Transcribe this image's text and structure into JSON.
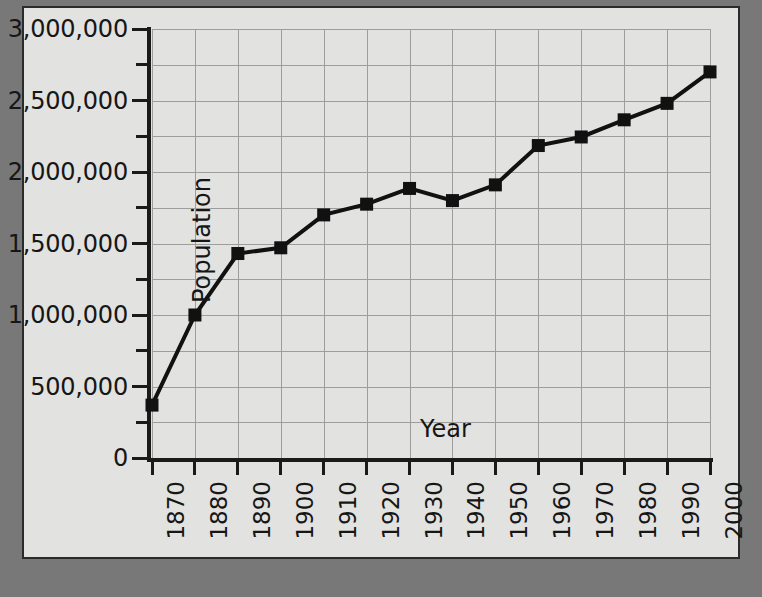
{
  "chart_data": {
    "type": "line",
    "title": "",
    "xlabel": "Year",
    "ylabel": "Population",
    "grid": true,
    "legend": false,
    "xlim": [
      1870,
      2000
    ],
    "ylim": [
      0,
      3000000
    ],
    "y_major_step": 500000,
    "y_minor_step": 250000,
    "x": [
      1870,
      1880,
      1890,
      1900,
      1910,
      1920,
      1930,
      1940,
      1950,
      1960,
      1970,
      1980,
      1990,
      2000
    ],
    "categories": [
      "1870",
      "1880",
      "1890",
      "1900",
      "1910",
      "1920",
      "1930",
      "1940",
      "1950",
      "1960",
      "1970",
      "1980",
      "1990",
      "2000"
    ],
    "values": [
      370000,
      1000000,
      1430000,
      1470000,
      1700000,
      1775000,
      1885000,
      1800000,
      1910000,
      2185000,
      2245000,
      2365000,
      2480000,
      2700000
    ],
    "ytick_labels": [
      "3,000,000",
      "2,500,000",
      "2,000,000",
      "1,500,000",
      "1,000,000",
      "500,000",
      "0"
    ],
    "ytick_values": [
      3000000,
      2500000,
      2000000,
      1500000,
      1000000,
      500000,
      0
    ],
    "marker": "square",
    "marker_color": "#111111",
    "line_color": "#111111",
    "line_width": 4,
    "plot_bg": "#e2e2e0",
    "grid_color": "#9d9d9d",
    "axis_color": "#1a1a1a",
    "page_bg": "#787878",
    "panel_border": "#2b2b2b"
  }
}
